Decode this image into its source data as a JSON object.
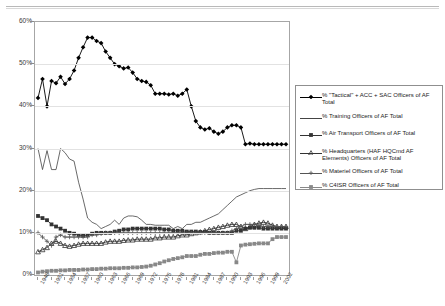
{
  "page": {
    "top_partial_text": ""
  },
  "chart_data": {
    "type": "line",
    "title": "",
    "xlabel": "",
    "ylabel": "",
    "ylim": [
      0,
      60
    ],
    "yticks": [
      "0%",
      "10%",
      "20%",
      "30%",
      "40%",
      "50%",
      "60%"
    ],
    "ytick_values": [
      0,
      10,
      20,
      30,
      40,
      50,
      60
    ],
    "grid": true,
    "legend_position": "right",
    "x": [
      1948,
      1949,
      1950,
      1951,
      1952,
      1953,
      1954,
      1955,
      1956,
      1957,
      1958,
      1959,
      1960,
      1961,
      1962,
      1963,
      1964,
      1965,
      1966,
      1967,
      1968,
      1969,
      1970,
      1971,
      1972,
      1973,
      1974,
      1975,
      1976,
      1977,
      1978,
      1979,
      1980,
      1981,
      1982,
      1983,
      1984,
      1985,
      1986,
      1987,
      1988,
      1989,
      1990,
      1991,
      1992,
      1993,
      1994,
      1995,
      1996,
      1997,
      1998,
      1999,
      2000,
      2001,
      2002,
      2003
    ],
    "xtick_labels": [
      "1948",
      "1951",
      "1954",
      "1957",
      "1960",
      "1963",
      "1966",
      "1969",
      "1972",
      "1975",
      "1978",
      "1981",
      "1984",
      "1987",
      "1990",
      "1993",
      "1996",
      "1999",
      "2002"
    ],
    "xtick_years": [
      1948,
      1951,
      1954,
      1957,
      1960,
      1963,
      1966,
      1969,
      1972,
      1975,
      1978,
      1981,
      1984,
      1987,
      1990,
      1993,
      1996,
      1999,
      2002
    ],
    "series": [
      {
        "name": "% \"Tactical\" + ACC + SAC Officers of AF Total",
        "marker": "diamond",
        "color": "#000000",
        "values": [
          42.0,
          46.5,
          40.0,
          46.0,
          45.5,
          47.0,
          45.3,
          46.5,
          48.5,
          51.5,
          54.0,
          56.3,
          56.3,
          55.5,
          55.0,
          53.0,
          51.5,
          50.0,
          49.5,
          49.0,
          49.2,
          48.0,
          46.5,
          46.0,
          45.8,
          45.0,
          43.0,
          43.0,
          43.0,
          42.8,
          43.0,
          42.5,
          43.0,
          44.0,
          40.0,
          36.5,
          35.0,
          34.5,
          34.8,
          34.0,
          33.5,
          34.0,
          35.0,
          35.5,
          35.5,
          35.0,
          31.0,
          31.2,
          31.0,
          31.0,
          31.0,
          31.0,
          31.0,
          31.0,
          31.0,
          31.0
        ]
      },
      {
        "name": "% Training Officers of AF Total",
        "marker": "none",
        "color": "#444444",
        "values": [
          30.0,
          25.0,
          29.5,
          25.0,
          25.0,
          30.0,
          29.0,
          27.5,
          27.0,
          22.0,
          18.0,
          13.5,
          12.5,
          12.0,
          11.0,
          11.5,
          12.0,
          13.0,
          12.0,
          13.5,
          14.0,
          14.0,
          13.8,
          13.0,
          12.0,
          12.0,
          11.8,
          11.8,
          11.8,
          11.8,
          11.0,
          11.5,
          11.0,
          12.0,
          12.0,
          12.5,
          12.5,
          13.0,
          13.5,
          14.0,
          14.5,
          15.5,
          16.5,
          17.5,
          18.5,
          19.0,
          19.5,
          20.0,
          20.3,
          20.5,
          20.5,
          20.5,
          20.5,
          20.5,
          20.5,
          20.5
        ]
      },
      {
        "name": "% Air Transport Officers of AF Total",
        "marker": "square",
        "color": "#333333",
        "values": [
          14.0,
          13.5,
          13.0,
          12.0,
          11.5,
          11.0,
          10.5,
          10.0,
          9.8,
          9.5,
          9.3,
          9.5,
          9.8,
          10.0,
          10.0,
          10.0,
          10.0,
          10.3,
          10.5,
          10.8,
          10.8,
          11.0,
          11.0,
          11.0,
          11.0,
          11.0,
          11.0,
          11.0,
          10.8,
          10.8,
          10.5,
          10.5,
          10.5,
          10.3,
          10.3,
          10.3,
          10.2,
          10.2,
          10.0,
          10.0,
          10.0,
          10.0,
          10.0,
          10.0,
          10.5,
          10.5,
          11.0,
          11.2,
          11.2,
          11.2,
          11.0,
          11.0,
          11.0,
          11.0,
          11.0,
          11.0
        ]
      },
      {
        "name": "% Headquarters (HAF HQCmd AF Elements) Officers of AF Total",
        "marker": "triangle",
        "color": "#333333",
        "values": [
          5.5,
          6.0,
          6.5,
          7.5,
          8.0,
          7.5,
          7.0,
          6.8,
          7.0,
          7.3,
          7.5,
          7.5,
          7.5,
          7.5,
          7.5,
          7.8,
          8.0,
          8.0,
          8.0,
          8.2,
          8.3,
          8.3,
          8.5,
          8.5,
          8.5,
          8.5,
          8.8,
          8.8,
          9.0,
          9.0,
          9.0,
          9.3,
          9.5,
          9.5,
          9.8,
          10.0,
          10.2,
          10.5,
          10.8,
          11.0,
          11.3,
          11.5,
          11.8,
          12.0,
          12.0,
          11.5,
          11.0,
          11.5,
          12.0,
          12.3,
          12.5,
          12.3,
          11.8,
          11.5,
          11.5,
          11.5
        ]
      },
      {
        "name": "% Materiel Officers of AF Total",
        "marker": "plus",
        "color": "#555555",
        "values": [
          10.0,
          9.0,
          8.0,
          7.0,
          9.0,
          9.5,
          9.0,
          9.0,
          9.0,
          9.0,
          9.0,
          9.0,
          9.5,
          9.5,
          9.8,
          10.0,
          10.0,
          10.0,
          10.0,
          10.0,
          10.0,
          10.0,
          10.0,
          10.0,
          10.0,
          10.0,
          10.0,
          10.0,
          10.0,
          10.0,
          10.0,
          10.0,
          10.0,
          10.0,
          10.0,
          10.0,
          10.0,
          10.0,
          10.0,
          10.0,
          10.0,
          10.0,
          10.0,
          10.5,
          11.0,
          11.5,
          12.0,
          12.0,
          12.0,
          11.8,
          11.5,
          11.5,
          11.5,
          11.5,
          11.5,
          11.5
        ]
      },
      {
        "name": "% C4ISR Officers of AF Total",
        "marker": "square",
        "color": "#888888",
        "values": [
          0.6,
          0.8,
          0.9,
          1.0,
          1.0,
          1.1,
          1.1,
          1.2,
          1.2,
          1.2,
          1.3,
          1.3,
          1.4,
          1.4,
          1.5,
          1.5,
          1.6,
          1.6,
          1.6,
          1.7,
          1.7,
          1.8,
          1.8,
          1.9,
          2.0,
          2.2,
          2.5,
          2.8,
          3.2,
          3.5,
          3.8,
          4.0,
          4.2,
          4.5,
          4.5,
          4.5,
          4.8,
          5.0,
          5.0,
          5.2,
          5.3,
          5.3,
          5.5,
          5.5,
          3.0,
          7.0,
          7.2,
          7.3,
          7.4,
          7.5,
          7.5,
          7.5,
          8.5,
          9.0,
          9.0,
          9.0
        ]
      }
    ]
  }
}
